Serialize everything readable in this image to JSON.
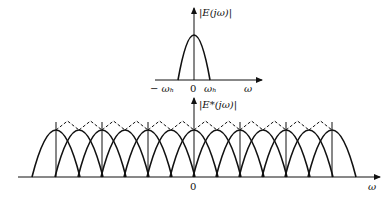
{
  "top_plot": {
    "ylabel": "|E(jω)|",
    "xlabel": "ω",
    "ticks": [
      "− ωₕ",
      "0",
      "ωₕ"
    ]
  },
  "bottom_plot": {
    "ylabel": "|E*(jω)|",
    "xlabel": "ω",
    "origin_label": "0"
  },
  "colors": {
    "stroke": "#111111",
    "background": "#ffffff"
  }
}
